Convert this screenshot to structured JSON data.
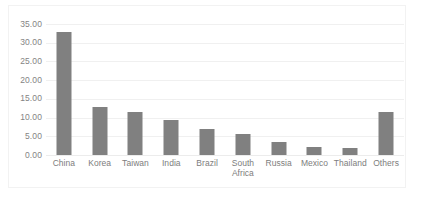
{
  "chart_data": {
    "type": "bar",
    "title": "",
    "subtitle": "",
    "xlabel": "",
    "ylabel": "",
    "categories": [
      "China",
      "Korea",
      "Taiwan",
      "India",
      "Brazil",
      "South\nAfrica",
      "Russia",
      "Mexico",
      "Thailand",
      "Others"
    ],
    "values": [
      33.0,
      12.7,
      11.5,
      9.3,
      7.0,
      5.5,
      3.5,
      2.2,
      1.8,
      11.5
    ],
    "ylim": [
      0,
      35
    ],
    "ytick_step": 5,
    "ytick_labels": [
      "35.00",
      "30.00",
      "25.00",
      "20.00",
      "15.00",
      "10.00",
      "5.00",
      "0.00"
    ],
    "ytick_values": [
      35,
      30,
      25,
      20,
      15,
      10,
      5,
      0
    ],
    "grid": "horizontal",
    "legend": "none",
    "bar_color": "#808080",
    "gridline_color": "#f0f0f0",
    "axis_text_color": "#7d7d7d",
    "background_color": "#ffffff",
    "border_color": "#f2f2f2"
  }
}
